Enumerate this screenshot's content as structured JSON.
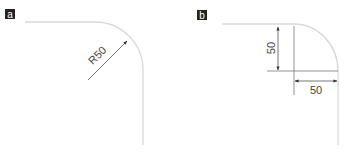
{
  "panels": [
    {
      "label": "a",
      "dimension_text": "R50",
      "description": "Rounded corner with radius dimension"
    },
    {
      "label": "b",
      "vertical_dimension_text": "50",
      "horizontal_dimension_text": "50",
      "description": "Rounded corner with orthogonal offset dimensions"
    }
  ],
  "colors": {
    "label_bg": "#222222",
    "label_fg": "#ffffff",
    "curve": "#d9d9d9",
    "dimension": "#444444",
    "text": "#444444"
  }
}
